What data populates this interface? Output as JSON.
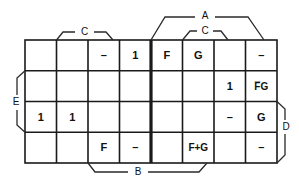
{
  "diagram": {
    "type": "karnaugh-map",
    "columns": 8,
    "rows": 4,
    "ink_color": "#1a1a1a",
    "background_color": "#ffffff",
    "grid": {
      "rows": [
        {
          "row_index": 1,
          "cells": [
            {
              "col": 1,
              "value": ""
            },
            {
              "col": 2,
              "value": ""
            },
            {
              "col": 3,
              "value": "–"
            },
            {
              "col": 4,
              "value": "1"
            },
            {
              "col": 5,
              "value": "F"
            },
            {
              "col": 6,
              "value": "G"
            },
            {
              "col": 7,
              "value": ""
            },
            {
              "col": 8,
              "value": "–"
            }
          ]
        },
        {
          "row_index": 2,
          "cells": [
            {
              "col": 1,
              "value": ""
            },
            {
              "col": 2,
              "value": ""
            },
            {
              "col": 3,
              "value": ""
            },
            {
              "col": 4,
              "value": ""
            },
            {
              "col": 5,
              "value": ""
            },
            {
              "col": 6,
              "value": ""
            },
            {
              "col": 7,
              "value": "1"
            },
            {
              "col": 8,
              "value": "F̅G"
            }
          ]
        },
        {
          "row_index": 3,
          "cells": [
            {
              "col": 1,
              "value": "1"
            },
            {
              "col": 2,
              "value": "1"
            },
            {
              "col": 3,
              "value": ""
            },
            {
              "col": 4,
              "value": ""
            },
            {
              "col": 5,
              "value": ""
            },
            {
              "col": 6,
              "value": ""
            },
            {
              "col": 7,
              "value": "–"
            },
            {
              "col": 8,
              "value": "G"
            }
          ]
        },
        {
          "row_index": 4,
          "cells": [
            {
              "col": 1,
              "value": ""
            },
            {
              "col": 2,
              "value": ""
            },
            {
              "col": 3,
              "value": "F"
            },
            {
              "col": 4,
              "value": "–"
            },
            {
              "col": 5,
              "value": ""
            },
            {
              "col": 6,
              "value": "F+G"
            },
            {
              "col": 7,
              "value": ""
            },
            {
              "col": 8,
              "value": "–"
            }
          ]
        }
      ]
    },
    "brackets": {
      "top_left_c": {
        "label": "C",
        "position": "top",
        "spans_columns": "2-4"
      },
      "top_right_a": {
        "label": "A",
        "position": "top-outer",
        "spans_columns": "5-8"
      },
      "top_right_c": {
        "label": "C",
        "position": "top-inner",
        "spans_columns": "6-7"
      },
      "bottom_b": {
        "label": "B",
        "position": "bottom",
        "spans_columns": "3-6"
      },
      "left_e": {
        "label": "E",
        "position": "left",
        "spans_rows": "2-3"
      },
      "right_d": {
        "label": "D",
        "position": "right",
        "spans_rows": "3-4"
      }
    }
  }
}
